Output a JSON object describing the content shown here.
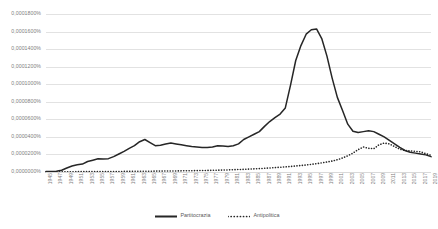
{
  "chart_data": {
    "type": "line",
    "title": "",
    "xlabel": "",
    "ylabel": "",
    "grid": true,
    "legend_position": "bottom",
    "ylim": [
      0.0,
      0.00018
    ],
    "ytick_labels": [
      "0,0001800%",
      "0,0001600%",
      "0,0001400%",
      "0,0001200%",
      "0,0001000%",
      "0,0000800%",
      "0,0000600%",
      "0,0000400%",
      "0,0000200%",
      "0,0000000%"
    ],
    "ytick_values": [
      0.00018,
      0.00016,
      0.00014,
      0.00012,
      0.0001,
      8e-05,
      6e-05,
      4e-05,
      2e-05,
      0.0
    ],
    "categories": [
      "1945",
      "1946",
      "1947",
      "1948",
      "1949",
      "1950",
      "1951",
      "1952",
      "1953",
      "1954",
      "1955",
      "1956",
      "1957",
      "1958",
      "1959",
      "1960",
      "1961",
      "1962",
      "1963",
      "1964",
      "1965",
      "1966",
      "1967",
      "1968",
      "1969",
      "1970",
      "1971",
      "1972",
      "1973",
      "1974",
      "1975",
      "1976",
      "1977",
      "1978",
      "1979",
      "1980",
      "1981",
      "1982",
      "1983",
      "1984",
      "1985",
      "1986",
      "1987",
      "1988",
      "1989",
      "1990",
      "1991",
      "1992",
      "1993",
      "1994",
      "1995",
      "1996",
      "1997",
      "1998",
      "1999",
      "2000",
      "2001",
      "2002",
      "2003",
      "2004",
      "2005",
      "2006",
      "2007",
      "2008",
      "2009",
      "2010",
      "2011",
      "2012",
      "2013",
      "2014",
      "2015",
      "2016",
      "2017",
      "2018",
      "2019"
    ],
    "xtick_labels": [
      "1945",
      "1947",
      "1949",
      "1951",
      "1953",
      "1955",
      "1957",
      "1959",
      "1961",
      "1963",
      "1965",
      "1967",
      "1969",
      "1971",
      "1973",
      "1975",
      "1977",
      "1979",
      "1981",
      "1983",
      "1985",
      "1987",
      "1989",
      "1991",
      "1993",
      "1995",
      "1997",
      "1999",
      "2001",
      "2003",
      "2005",
      "2007",
      "2009",
      "2011",
      "2013",
      "2015",
      "2017",
      "2019"
    ],
    "series": [
      {
        "name": "Partitocrazia",
        "style": "solid",
        "color": "#262626",
        "values": [
          5e-07,
          6e-07,
          8e-07,
          2e-06,
          4.5e-06,
          6.8e-06,
          8.2e-06,
          9e-06,
          1.2e-05,
          1.35e-05,
          1.5e-05,
          1.48e-05,
          1.52e-05,
          1.75e-05,
          2.05e-05,
          2.35e-05,
          2.7e-05,
          3e-05,
          3.45e-05,
          3.7e-05,
          3.35e-05,
          3e-05,
          3.05e-05,
          3.2e-05,
          3.3e-05,
          3.2e-05,
          3.1e-05,
          3e-05,
          2.9e-05,
          2.85e-05,
          2.8e-05,
          2.78e-05,
          2.85e-05,
          3e-05,
          2.96e-05,
          2.9e-05,
          3e-05,
          3.2e-05,
          3.7e-05,
          4e-05,
          4.3e-05,
          4.6e-05,
          5.2e-05,
          5.75e-05,
          6.2e-05,
          6.6e-05,
          7.3e-05,
          9.9e-05,
          0.000127,
          0.000144,
          0.000157,
          0.000162,
          0.000163,
          0.000152,
          0.000132,
          0.000107,
          8.5e-05,
          7e-05,
          5.45e-05,
          4.65e-05,
          4.5e-05,
          4.6e-05,
          4.7e-05,
          4.6e-05,
          4.3e-05,
          4e-05,
          3.6e-05,
          3.2e-05,
          2.8e-05,
          2.45e-05,
          2.25e-05,
          2.15e-05,
          2.05e-05,
          1.95e-05,
          1.75e-05
        ]
      },
      {
        "name": "Antipolitica",
        "style": "dotted",
        "color": "#262626",
        "values": [
          2e-07,
          2e-07,
          2e-07,
          3e-07,
          3e-07,
          3e-07,
          4e-07,
          4e-07,
          4e-07,
          5e-07,
          5e-07,
          5e-07,
          6e-07,
          6e-07,
          6e-07,
          7e-07,
          7e-07,
          8e-07,
          8e-07,
          9e-07,
          9e-07,
          1e-06,
          1e-06,
          1.1e-06,
          1.2e-06,
          1.2e-06,
          1.3e-06,
          1.4e-06,
          1.5e-06,
          1.6e-06,
          1.7e-06,
          1.8e-06,
          1.9e-06,
          2.1e-06,
          2.2e-06,
          2.4e-06,
          2.6e-06,
          2.8e-06,
          3e-06,
          3.3e-06,
          3.6e-06,
          3.9e-06,
          4.2e-06,
          4.6e-06,
          5e-06,
          5.4e-06,
          5.8e-06,
          6.3e-06,
          6.8e-06,
          7.4e-06,
          8e-06,
          8.7e-06,
          9.5e-06,
          1.04e-05,
          1.14e-05,
          1.25e-05,
          1.4e-05,
          1.6e-05,
          1.85e-05,
          2.15e-05,
          2.55e-05,
          2.85e-05,
          2.7e-05,
          2.65e-05,
          3.1e-05,
          3.3e-05,
          3.2e-05,
          2.9e-05,
          2.6e-05,
          2.45e-05,
          2.4e-05,
          2.35e-05,
          2.3e-05,
          2.1e-05,
          1.9e-05
        ]
      }
    ]
  },
  "legend": {
    "items": [
      {
        "label": "Partitocrazia",
        "style": "solid"
      },
      {
        "label": "Antipolitica",
        "style": "dotted"
      }
    ]
  }
}
